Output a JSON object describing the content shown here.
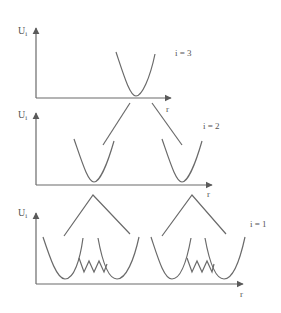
{
  "figure": {
    "type": "potential-energy-hierarchy",
    "stroke_color": "#6a6a6a",
    "panels": [
      {
        "level_label": "i = 3",
        "y_axis_label": "U",
        "y_axis_subscript": "i",
        "x_axis_label": "r",
        "wells": 1
      },
      {
        "level_label": "i = 2",
        "y_axis_label": "U",
        "y_axis_subscript": "i",
        "x_axis_label": "r",
        "wells": 2
      },
      {
        "level_label": "i = 1",
        "y_axis_label": "U",
        "y_axis_subscript": "i",
        "x_axis_label": "r",
        "wells": 4,
        "has_zigzag_barriers": true
      }
    ]
  }
}
